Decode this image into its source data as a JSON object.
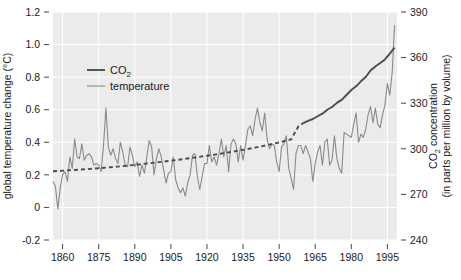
{
  "chart_data": {
    "type": "line",
    "title": "",
    "xlabel": "",
    "ylabel": "global temperature change (°C)",
    "y2label_line1": "CO",
    "y2label_line1_sub": "2",
    "y2label_line1_rest": " concentration",
    "y2label_line2": "(in parts per million by volume)",
    "xlim": [
      1856,
      1999
    ],
    "ylim": [
      -0.2,
      1.2
    ],
    "y2lim": [
      240,
      390
    ],
    "grid": true,
    "legend_position": "top-left-inside",
    "xticks": [
      1860,
      1875,
      1890,
      1905,
      1920,
      1935,
      1950,
      1965,
      1980,
      1995
    ],
    "xtick_labels": [
      "1860",
      "1875",
      "1890",
      "1905",
      "1920",
      "1935",
      "1950",
      "1965",
      "1980",
      "1995"
    ],
    "yticks": [
      -0.2,
      0,
      0.2,
      0.4,
      0.6,
      0.8,
      1.0,
      1.2
    ],
    "ytick_labels": [
      "-0.2",
      "0",
      "0.2",
      "0.4",
      "0.6",
      "0.8",
      "1.0",
      "1.2"
    ],
    "y2ticks": [
      240,
      270,
      300,
      330,
      360,
      390
    ],
    "y2tick_labels": [
      "240",
      "270",
      "300",
      "330",
      "360",
      "390"
    ],
    "legend": [
      {
        "name": "CO2",
        "label_main": "CO",
        "label_sub": "2",
        "color": "#4d4d4d",
        "width": 1.9,
        "axis": "right"
      },
      {
        "name": "temperature",
        "label_main": "temperature",
        "label_sub": "",
        "color": "#8a8a8a",
        "width": 1.1,
        "axis": "left"
      }
    ],
    "series": [
      {
        "name": "temperature",
        "axis": "left",
        "color": "#8a8a8a",
        "width": 1.1,
        "x": [
          1856,
          1857,
          1858,
          1859,
          1860,
          1861,
          1862,
          1863,
          1864,
          1865,
          1866,
          1867,
          1868,
          1869,
          1870,
          1871,
          1872,
          1873,
          1874,
          1875,
          1876,
          1877,
          1878,
          1879,
          1880,
          1881,
          1882,
          1883,
          1884,
          1885,
          1886,
          1887,
          1888,
          1889,
          1890,
          1891,
          1892,
          1893,
          1894,
          1895,
          1896,
          1897,
          1898,
          1899,
          1900,
          1901,
          1902,
          1903,
          1904,
          1905,
          1906,
          1907,
          1908,
          1909,
          1910,
          1911,
          1912,
          1913,
          1914,
          1915,
          1916,
          1917,
          1918,
          1919,
          1920,
          1921,
          1922,
          1923,
          1924,
          1925,
          1926,
          1927,
          1928,
          1929,
          1930,
          1931,
          1932,
          1933,
          1934,
          1935,
          1936,
          1937,
          1938,
          1939,
          1940,
          1941,
          1942,
          1943,
          1944,
          1945,
          1946,
          1947,
          1948,
          1949,
          1950,
          1951,
          1952,
          1953,
          1954,
          1955,
          1956,
          1957,
          1958,
          1959,
          1960,
          1961,
          1962,
          1963,
          1964,
          1965,
          1966,
          1967,
          1968,
          1969,
          1970,
          1971,
          1972,
          1973,
          1974,
          1975,
          1976,
          1977,
          1978,
          1979,
          1980,
          1981,
          1982,
          1983,
          1984,
          1985,
          1986,
          1987,
          1988,
          1989,
          1990,
          1991,
          1992,
          1993,
          1994,
          1995,
          1996,
          1997,
          1998
        ],
        "y": [
          0.16,
          0.13,
          -0.01,
          0.12,
          0.2,
          0.22,
          0.16,
          0.31,
          0.24,
          0.42,
          0.31,
          0.3,
          0.39,
          0.29,
          0.32,
          0.33,
          0.31,
          0.26,
          0.27,
          0.26,
          0.22,
          0.38,
          0.61,
          0.37,
          0.32,
          0.36,
          0.3,
          0.27,
          0.4,
          0.34,
          0.26,
          0.25,
          0.37,
          0.32,
          0.25,
          0.28,
          0.19,
          0.26,
          0.21,
          0.31,
          0.41,
          0.37,
          0.2,
          0.3,
          0.36,
          0.31,
          0.23,
          0.15,
          0.21,
          0.22,
          0.31,
          0.17,
          0.12,
          0.09,
          0.12,
          0.07,
          0.15,
          0.2,
          0.32,
          0.33,
          0.19,
          0.11,
          0.19,
          0.27,
          0.27,
          0.38,
          0.28,
          0.31,
          0.26,
          0.33,
          0.42,
          0.31,
          0.38,
          0.22,
          0.39,
          0.42,
          0.39,
          0.28,
          0.38,
          0.29,
          0.38,
          0.48,
          0.5,
          0.44,
          0.54,
          0.61,
          0.52,
          0.47,
          0.58,
          0.42,
          0.36,
          0.39,
          0.38,
          0.28,
          0.22,
          0.37,
          0.39,
          0.44,
          0.24,
          0.18,
          0.11,
          0.33,
          0.38,
          0.38,
          0.33,
          0.38,
          0.34,
          0.3,
          0.16,
          0.27,
          0.34,
          0.38,
          0.26,
          0.4,
          0.42,
          0.26,
          0.29,
          0.44,
          0.3,
          0.24,
          0.21,
          0.46,
          0.45,
          0.44,
          0.43,
          0.51,
          0.58,
          0.4,
          0.45,
          0.43,
          0.48,
          0.57,
          0.62,
          0.52,
          0.61,
          0.51,
          0.49,
          0.57,
          0.63,
          0.76,
          0.69,
          0.83,
          1.12
        ]
      },
      {
        "name": "CO2",
        "axis": "right",
        "color": "#4d4d4d",
        "width": 1.9,
        "dashed_until": 1958,
        "x": [
          1856,
          1860,
          1865,
          1870,
          1875,
          1880,
          1885,
          1890,
          1895,
          1900,
          1905,
          1910,
          1915,
          1920,
          1925,
          1930,
          1935,
          1940,
          1945,
          1950,
          1955,
          1958,
          1960,
          1962,
          1964,
          1966,
          1968,
          1970,
          1972,
          1974,
          1976,
          1978,
          1980,
          1982,
          1984,
          1986,
          1988,
          1990,
          1992,
          1994,
          1996,
          1998
        ],
        "y": [
          285.2,
          285.6,
          286.1,
          286.6,
          287.2,
          287.9,
          288.6,
          289.4,
          290.3,
          291.2,
          292.2,
          293.2,
          294.3,
          295.4,
          296.6,
          297.9,
          299.3,
          300.8,
          302.4,
          304.2,
          306.2,
          314.7,
          316.9,
          318.4,
          319.6,
          321.4,
          323.1,
          325.7,
          327.5,
          330.2,
          332.2,
          335.4,
          338.7,
          341.1,
          344.4,
          347.2,
          351.5,
          354.2,
          356.4,
          358.8,
          362.6,
          366.6
        ]
      }
    ]
  },
  "plot": {
    "bg_color": "#ebebeb",
    "grid_color": "#ffffff",
    "page_bg": "#ffffff",
    "text_color": "#1a1a1a"
  }
}
